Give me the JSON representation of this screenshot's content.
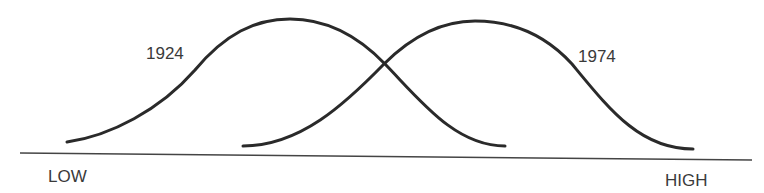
{
  "diagram": {
    "curves": [
      {
        "label": "1924",
        "start": [
          67,
          142
        ],
        "peak": [
          290,
          19
        ],
        "end": [
          505,
          146
        ]
      },
      {
        "label": "1974",
        "start": [
          243,
          146
        ],
        "peak": [
          475,
          21
        ],
        "end": [
          693,
          149
        ]
      }
    ],
    "axis": {
      "low_label": "LOW",
      "high_label": "HIGH"
    },
    "colors": {
      "curve": "#2a2a2a",
      "axis": "#444444",
      "text": "#3a3a3a",
      "background": "#ffffff"
    }
  }
}
